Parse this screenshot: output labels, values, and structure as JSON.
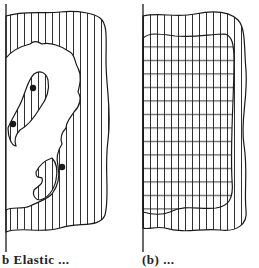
{
  "figure": {
    "panels": [
      {
        "id": "left",
        "description": "Vertically hatched region with an irregular white blob containing a hatched S-shaped channel and three black dots",
        "hatch": "vertical",
        "dots": 3
      },
      {
        "id": "right",
        "description": "Region with horizontal lines inside, surrounded by a vertically hatched wavy border band",
        "hatch_inner": "horizontal",
        "hatch_border": "vertical"
      }
    ],
    "caption_left": "b  Elastic ...",
    "caption_right": "(b) ..."
  },
  "colors": {
    "ink": "#1a1a1a",
    "background": "#ffffff"
  }
}
